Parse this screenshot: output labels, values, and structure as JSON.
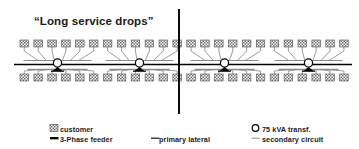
{
  "title": {
    "text": "“Long service drops”"
  },
  "colors": {
    "customer_fill": "#8c8c8c",
    "customer_stroke": "#4d4d4d",
    "feeder": "#000000",
    "primary_lateral": "#000000",
    "secondary_circuit": "#8a8a8a",
    "transformer_stroke": "#000000",
    "transformer_fill": "#ffffff",
    "divider": "#000000",
    "text": "#1a1a1a",
    "background": "#ffffff"
  },
  "diagram": {
    "divider_x": 179,
    "feeder_y": 64.5,
    "top_customer_row_y": 40,
    "bottom_customer_row_y": 74,
    "customer_width": 8.5,
    "customer_height": 7,
    "customer_spacing": 13.9,
    "customer_count_top": 24,
    "customer_count_bottom": 24,
    "customer_row_start_x": 20,
    "transformers": [
      {
        "name": "transformer-1",
        "x": 57.5,
        "y": 63,
        "rating": "75 kVA"
      },
      {
        "name": "transformer-2",
        "x": 139.5,
        "y": 63,
        "rating": "75 kVA"
      },
      {
        "name": "transformer-3",
        "x": 224.5,
        "y": 63,
        "rating": "75 kVA"
      },
      {
        "name": "transformer-4",
        "x": 308.5,
        "y": 63,
        "rating": "75 kVA"
      }
    ],
    "transformer_radius": 4.1,
    "primary_lateral_y_top": 60.5,
    "primary_lateral_y_bottom": 69.5,
    "feeder_x_start": 14,
    "feeder_x_end": 352
  },
  "legend": {
    "items": [
      {
        "key": "customer",
        "label": "customer",
        "symbol": "hatched-square"
      },
      {
        "key": "three_phase_feeder",
        "label": "3-Phase feeder",
        "symbol": "thick-black-line"
      },
      {
        "key": "primary_lateral",
        "label": "primary lateral",
        "symbol": "thin-black-line"
      },
      {
        "key": "transformer",
        "label": "75 kVA transf.",
        "symbol": "open-circle"
      },
      {
        "key": "secondary_circuit",
        "label": "secondary circuit",
        "symbol": "thin-gray-line"
      }
    ]
  }
}
